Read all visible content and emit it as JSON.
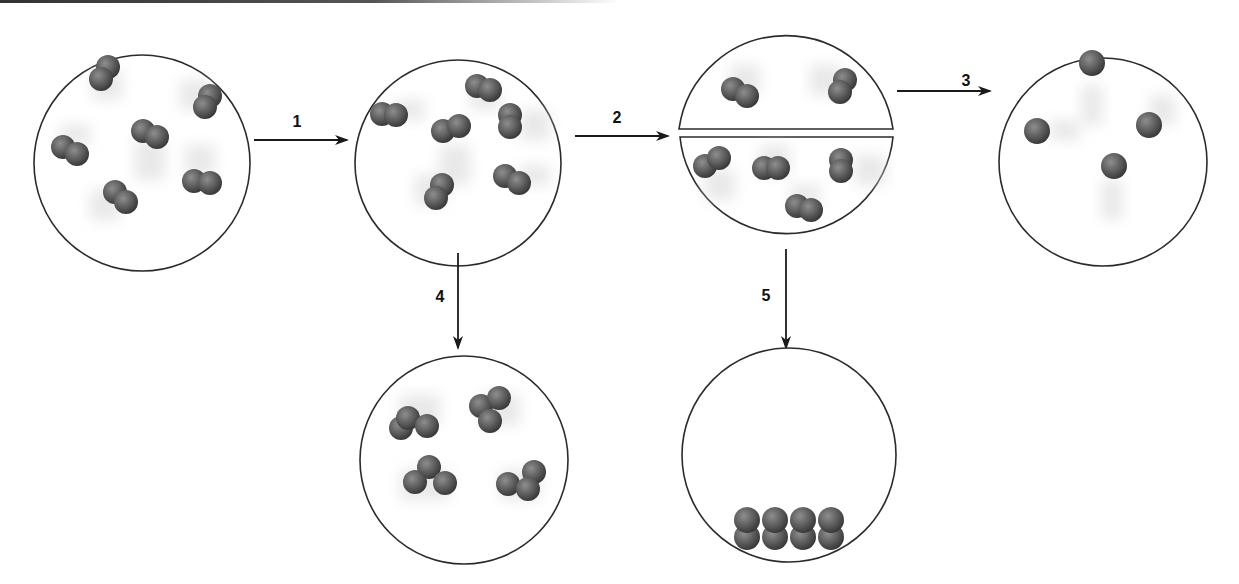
{
  "diagram": {
    "colors": {
      "circle_stroke": "#2b2b2b",
      "atom_fill": "#5f5f5f",
      "atom_highlight": "#8a8a8a",
      "atom_shadow": "#3d3d3d",
      "arrow": "#1a1a1a",
      "motion_blur": "#d9d9d9"
    },
    "steps": [
      {
        "label": "1",
        "from": "initial",
        "to": "after-1",
        "direction": "right"
      },
      {
        "label": "2",
        "from": "after-1",
        "to": "after-2-split",
        "direction": "right"
      },
      {
        "label": "3",
        "from": "after-2-split",
        "to": "after-3",
        "direction": "right"
      },
      {
        "label": "4",
        "from": "after-1",
        "to": "after-4",
        "direction": "down"
      },
      {
        "label": "5",
        "from": "after-2-split",
        "to": "after-5",
        "direction": "down"
      }
    ],
    "containers": [
      {
        "id": "initial",
        "contents": "6 diatomic molecules, gas, with motion blur",
        "molecule_count": 6
      },
      {
        "id": "after-1",
        "contents": "6 diatomic molecules, gas, with motion blur",
        "molecule_count": 6
      },
      {
        "id": "after-2-split",
        "contents": "container divided by wall; 2 molecules top, 4 molecules bottom",
        "molecule_count": 6
      },
      {
        "id": "after-3",
        "contents": "4 single atoms, gas",
        "molecule_count": 4
      },
      {
        "id": "after-4",
        "contents": "4 triatomic molecules",
        "molecule_count": 4
      },
      {
        "id": "after-5",
        "contents": "8 diatomic molecules stacked at bottom (condensed)",
        "molecule_count": 8
      }
    ]
  }
}
